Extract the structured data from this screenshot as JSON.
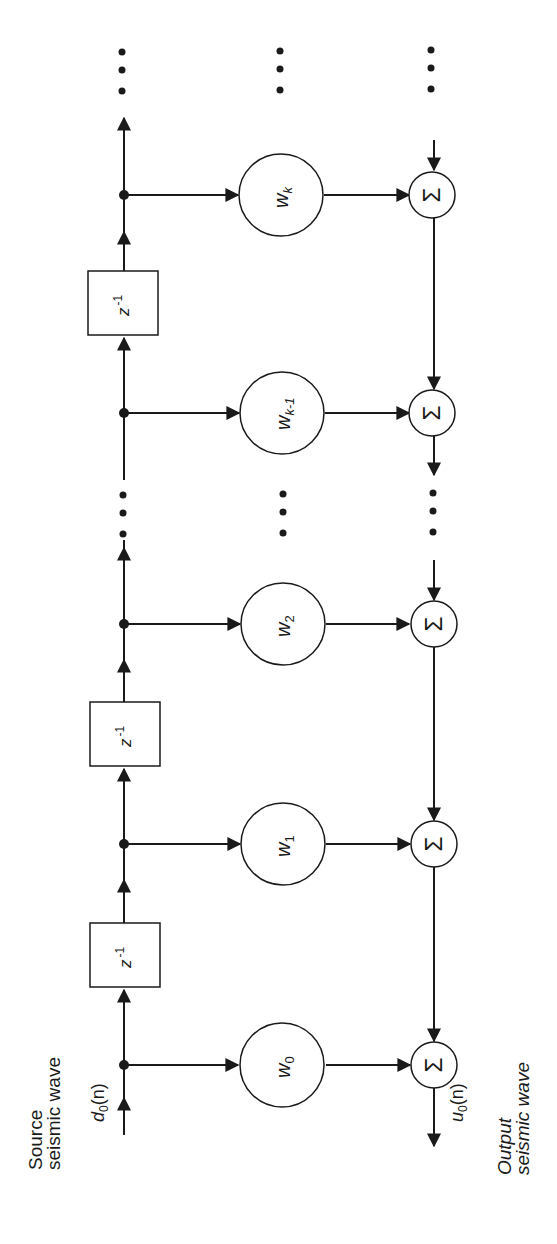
{
  "diagram": {
    "type": "tapped-delay-line FIR filter (rotated 90° counter-clockwise)",
    "source_label": [
      "Source",
      "seismic wave"
    ],
    "output_label": [
      "Output",
      "seismic wave"
    ],
    "input_signal": {
      "base": "d",
      "sub": "0",
      "arg": "(n)"
    },
    "output_signal": {
      "base": "u",
      "sub": "0",
      "arg": "(n)"
    },
    "delay_label": {
      "base": "z",
      "sup": "-1"
    },
    "sum_symbol": "Σ",
    "ellipsis": "⋮",
    "weights": [
      {
        "base": "w",
        "sub": "0"
      },
      {
        "base": "w",
        "sub": "1"
      },
      {
        "base": "w",
        "sub": "2"
      },
      {
        "base": "w",
        "sub": "k-1"
      },
      {
        "base": "w",
        "sub": "k"
      }
    ]
  },
  "colors": {
    "line": "#1a1a1a",
    "background": "#ffffff"
  }
}
